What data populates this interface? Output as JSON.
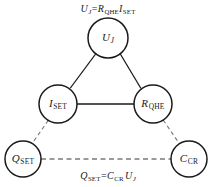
{
  "diagram": {
    "type": "node-link-diagram",
    "background_color": "#ffffff",
    "stroke_color": "#1a1a1a",
    "dashed_stroke_color": "#7a7a7a",
    "nodes": [
      {
        "id": "u-j",
        "name": "Josephson voltage",
        "symbol": "U",
        "subscript": "J",
        "subscript_style": "italic",
        "cx": 108,
        "cy": 38,
        "r": 20
      },
      {
        "id": "i-set",
        "name": "Single electron tunnelling current",
        "symbol": "I",
        "subscript": "SET",
        "subscript_style": "upright",
        "cx": 58,
        "cy": 104,
        "r": 19
      },
      {
        "id": "r-qhe",
        "name": "Quantum Hall resistance",
        "symbol": "R",
        "subscript": "QHE",
        "subscript_style": "upright",
        "cx": 153,
        "cy": 104,
        "r": 19
      },
      {
        "id": "q-set",
        "name": "Single electron tunnelling charge",
        "symbol": "Q",
        "subscript": "SET",
        "subscript_style": "upright",
        "cx": 23,
        "cy": 159,
        "r": 18
      },
      {
        "id": "c-cr",
        "name": "Cryogenic capacitance",
        "symbol": "C",
        "subscript": "CR",
        "subscript_style": "upright",
        "cx": 189,
        "cy": 159,
        "r": 18
      }
    ],
    "edges": [
      {
        "id": "edge-uj-iset",
        "from": "u-j",
        "to": "i-set",
        "style": "solid"
      },
      {
        "id": "edge-uj-rqhe",
        "from": "u-j",
        "to": "r-qhe",
        "style": "solid"
      },
      {
        "id": "edge-iset-rqhe",
        "from": "i-set",
        "to": "r-qhe",
        "style": "solid"
      },
      {
        "id": "edge-iset-qset",
        "from": "i-set",
        "to": "q-set",
        "style": "dashed"
      },
      {
        "id": "edge-rqhe-ccr",
        "from": "r-qhe",
        "to": "c-cr",
        "style": "dashed"
      },
      {
        "id": "edge-qset-ccr",
        "from": "q-set",
        "to": "c-cr",
        "style": "dashed"
      }
    ],
    "equations": [
      {
        "id": "eq-top",
        "text": "UJ = RQHE ISET",
        "plain": "U_J = R_QHE I_SET",
        "x": 108,
        "y": 10
      },
      {
        "id": "eq-bottom",
        "text": "QSET = CCR UJ",
        "plain": "Q_SET = C_CR U_J",
        "x": 108,
        "y": 177
      }
    ]
  }
}
